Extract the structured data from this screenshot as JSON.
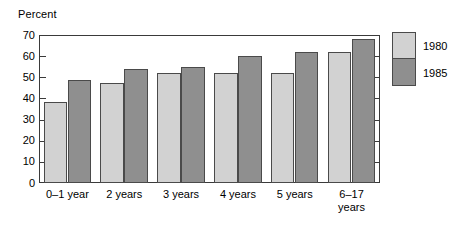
{
  "chart_data": {
    "type": "bar",
    "title": "",
    "subtitle": "",
    "xlabel": "",
    "ylabel": "Percent",
    "ylim": [
      0,
      70
    ],
    "yticks": [
      0,
      10,
      20,
      30,
      40,
      50,
      60,
      70
    ],
    "ytick_labels": [
      "0",
      "10",
      "20",
      "30",
      "40",
      "50",
      "60",
      "70"
    ],
    "grid": false,
    "legend_position": "right",
    "categories": [
      "0–1 year",
      "2 years",
      "3 years",
      "4 years",
      "5 years",
      "6–17 years"
    ],
    "category_lines": [
      [
        "0–1 year"
      ],
      [
        "2 years"
      ],
      [
        "3 years"
      ],
      [
        "4 years"
      ],
      [
        "5 years"
      ],
      [
        "6–17",
        "years"
      ]
    ],
    "series": [
      {
        "name": "1980",
        "color": "#d2d2d2",
        "values": [
          38.5,
          47.5,
          52,
          52,
          52,
          62
        ]
      },
      {
        "name": "1985",
        "color": "#8f8f8f",
        "values": [
          48.5,
          54,
          55,
          60,
          62,
          68
        ]
      }
    ]
  },
  "legend": {
    "entries": [
      {
        "label": "1980",
        "color": "#d2d2d2"
      },
      {
        "label": "1985",
        "color": "#8f8f8f"
      }
    ]
  },
  "axis": {
    "y_title": "Percent"
  },
  "colors": {
    "series_1980": "#d2d2d2",
    "series_1985": "#8f8f8f",
    "frame": "#3a3a3a",
    "bar_outline": "#4a4a4a",
    "background": "#ffffff",
    "text": "#000000"
  }
}
